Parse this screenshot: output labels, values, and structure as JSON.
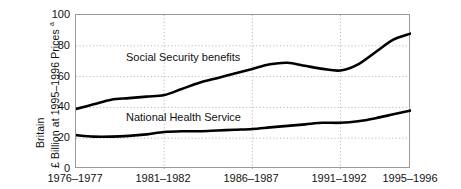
{
  "axis": {
    "y_title_line1": "Britain",
    "y_title_line2": "£ Billion at 1995–1996 Prices ",
    "y_title_superscript": "a",
    "y_ticks": [
      "100",
      "80",
      "60",
      "40",
      "20",
      "0"
    ],
    "x_ticks": [
      "1976–1977",
      "1981–1982",
      "1986–1987",
      "1991–1992",
      "1995–1996"
    ]
  },
  "labels": {
    "social_security": "Social Security benefits",
    "national_health": "National Health Service"
  },
  "colors": {
    "line": "#000000",
    "grid": "#b9b9b9",
    "frame": "#9a9a9a",
    "background": "#ffffff",
    "text": "#111111"
  },
  "chart_data": {
    "type": "line",
    "title": "",
    "subtitle": "",
    "xlabel": "",
    "ylabel": "Britain — £ Billion at 1995–1996 Prices",
    "ylim": [
      0,
      100
    ],
    "ytick_values": [
      0,
      20,
      40,
      60,
      80,
      100
    ],
    "grid": true,
    "grid_style": "dotted",
    "legend": "inline-labels",
    "x": [
      "1976–1977",
      "1977–1978",
      "1978–1979",
      "1979–1980",
      "1980–1981",
      "1981–1982",
      "1982–1983",
      "1983–1984",
      "1984–1985",
      "1985–1986",
      "1986–1987",
      "1987–1988",
      "1988–1989",
      "1989–1990",
      "1990–1991",
      "1991–1992",
      "1992–1993",
      "1993–1994",
      "1994–1995",
      "1995–1996"
    ],
    "xtick_labels": [
      "1976–1977",
      "1981–1982",
      "1986–1987",
      "1991–1992",
      "1995–1996"
    ],
    "xtick_indices": [
      0,
      5,
      10,
      15,
      19
    ],
    "series": [
      {
        "name": "Social Security benefits",
        "color": "#000000",
        "values": [
          39,
          42,
          45,
          46,
          47,
          48,
          52,
          56,
          59,
          62,
          65,
          68,
          69,
          67,
          65,
          64,
          68,
          76,
          84,
          88
        ]
      },
      {
        "name": "National Health Service",
        "color": "#000000",
        "values": [
          22,
          21,
          21,
          21.5,
          22.5,
          24,
          24.5,
          24.5,
          25,
          25.5,
          26,
          27,
          28,
          29,
          30,
          30,
          31,
          33,
          35.5,
          38
        ]
      }
    ]
  }
}
